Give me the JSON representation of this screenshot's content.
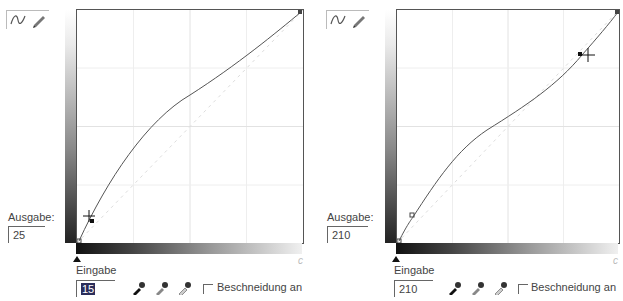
{
  "panels": [
    {
      "id": "left",
      "output_label": "Ausgabe:",
      "output_value": "25",
      "input_label": "Eingabe",
      "input_value": "15",
      "input_selected": true,
      "clipping_label": "Beschneidung an:",
      "tools": [
        "curve-tool",
        "pencil-tool"
      ],
      "eyedroppers": [
        "black-point",
        "gray-point",
        "white-point"
      ]
    },
    {
      "id": "right",
      "output_label": "Ausgabe:",
      "output_value": "210",
      "input_label": "Eingabe",
      "input_value": "210",
      "input_selected": false,
      "clipping_label": "Beschneidung an",
      "tools": [
        "curve-tool",
        "pencil-tool"
      ],
      "eyedroppers": [
        "black-point",
        "gray-point",
        "white-point"
      ]
    }
  ],
  "colors": {
    "curve": "#555555",
    "grid": "#e2e2e2",
    "selection": "#2b2d5a"
  }
}
